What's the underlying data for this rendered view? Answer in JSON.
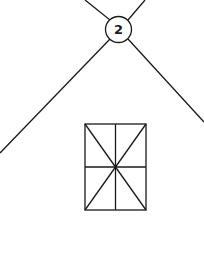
{
  "diagram": {
    "badge": {
      "label": "2"
    },
    "colors": {
      "stroke": "#1a1a1a",
      "background": "#ffffff"
    },
    "shapes": [
      {
        "type": "line",
        "name": "top-left-ray"
      },
      {
        "type": "line",
        "name": "top-right-ray"
      },
      {
        "type": "line",
        "name": "roof-left-line"
      },
      {
        "type": "line",
        "name": "roof-right-line"
      },
      {
        "type": "circle",
        "name": "number-badge"
      },
      {
        "type": "rect",
        "name": "window-grid"
      }
    ]
  }
}
